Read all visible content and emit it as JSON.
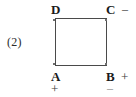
{
  "figure": {
    "number_label": "(2)",
    "shape": "square",
    "vertices": [
      {
        "id": "D",
        "label": "D",
        "position": "top-left",
        "sign": "",
        "sign_position": ""
      },
      {
        "id": "C",
        "label": "C",
        "position": "top-right",
        "sign": "–",
        "sign_position": "right"
      },
      {
        "id": "A",
        "label": "A",
        "position": "bottom-left",
        "sign": "+",
        "sign_position": "below"
      },
      {
        "id": "B",
        "label": "B",
        "position": "bottom-right",
        "sign": "+",
        "sign_position": "right"
      }
    ],
    "extra_signs": [
      {
        "id": "b-below",
        "sign": "–",
        "attached_to": "B",
        "sign_position": "below"
      }
    ],
    "colors": {
      "background": "#ffffff",
      "stroke": "#4a4a4a",
      "text": "#1a1a1a",
      "faint_text": "#8c8c8c"
    }
  }
}
